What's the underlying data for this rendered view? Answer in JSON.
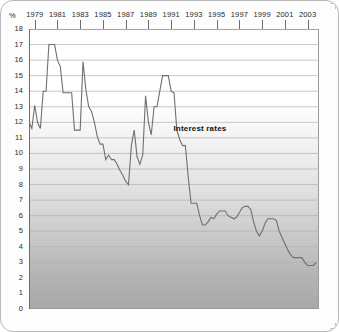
{
  "axes": {
    "y_unit_label": "%",
    "y_ticks": [
      "18",
      "17",
      "16",
      "15",
      "14",
      "13",
      "12",
      "11",
      "10",
      "9",
      "8",
      "7",
      "6",
      "5",
      "4",
      "3",
      "2",
      "1",
      "0"
    ],
    "x_ticks": [
      "1979",
      "1981",
      "1983",
      "1985",
      "1987",
      "1989",
      "1991",
      "1993",
      "1995",
      "1997",
      "1999",
      "2001",
      "2003"
    ]
  },
  "annotation": {
    "series_label": "Interest rates"
  },
  "colors": {
    "line": "#6f6f6f",
    "grid": "#b0b0b0",
    "axis": "#6e6e6e",
    "text": "#2b2b2b"
  },
  "chart_data": {
    "type": "line",
    "title": "",
    "subtitle": "",
    "xlabel": "",
    "ylabel": "%",
    "xlim": [
      1978.5,
      2004.0
    ],
    "ylim": [
      0,
      18
    ],
    "grid": true,
    "legend": "none",
    "annotations": [
      {
        "text": "Interest rates",
        "x": 1991.2,
        "y": 11.6
      }
    ],
    "xtick_values": [
      1979,
      1981,
      1983,
      1985,
      1987,
      1989,
      1991,
      1993,
      1995,
      1997,
      1999,
      2001,
      2003
    ],
    "ytick_values": [
      0,
      1,
      2,
      3,
      4,
      5,
      6,
      7,
      8,
      9,
      10,
      11,
      12,
      13,
      14,
      15,
      16,
      17,
      18
    ],
    "series": [
      {
        "name": "Interest rates",
        "x": [
          1978.5,
          1978.75,
          1979.0,
          1979.25,
          1979.5,
          1979.75,
          1980.0,
          1980.25,
          1980.5,
          1980.75,
          1981.0,
          1981.25,
          1981.5,
          1981.75,
          1982.0,
          1982.25,
          1982.5,
          1982.75,
          1983.0,
          1983.25,
          1983.5,
          1983.75,
          1984.0,
          1984.25,
          1984.5,
          1984.75,
          1985.0,
          1985.25,
          1985.5,
          1985.75,
          1986.0,
          1986.25,
          1986.5,
          1986.75,
          1987.0,
          1987.25,
          1987.5,
          1987.75,
          1988.0,
          1988.25,
          1988.5,
          1988.75,
          1989.0,
          1989.25,
          1989.5,
          1989.75,
          1990.0,
          1990.25,
          1990.5,
          1990.75,
          1991.0,
          1991.25,
          1991.5,
          1991.75,
          1992.0,
          1992.25,
          1992.5,
          1992.75,
          1993.0,
          1993.25,
          1993.5,
          1993.75,
          1994.0,
          1994.25,
          1994.5,
          1994.75,
          1995.0,
          1995.25,
          1995.5,
          1995.75,
          1996.0,
          1996.25,
          1996.5,
          1996.75,
          1997.0,
          1997.25,
          1997.5,
          1997.75,
          1998.0,
          1998.25,
          1998.5,
          1998.75,
          1999.0,
          1999.25,
          1999.5,
          1999.75,
          2000.0,
          2000.25,
          2000.5,
          2000.75,
          2001.0,
          2001.25,
          2001.5,
          2001.75,
          2002.0,
          2002.25,
          2002.5,
          2002.75,
          2003.0,
          2003.25,
          2003.5,
          2003.75
        ],
        "y": [
          12.0,
          11.6,
          13.1,
          12.0,
          11.6,
          14.0,
          14.0,
          17.0,
          17.0,
          17.0,
          16.0,
          15.6,
          13.9,
          13.9,
          13.9,
          13.9,
          11.5,
          11.5,
          11.5,
          15.9,
          14.1,
          13.0,
          12.7,
          12.0,
          11.1,
          10.6,
          10.6,
          9.6,
          9.9,
          9.6,
          9.6,
          9.3,
          8.9,
          8.6,
          8.2,
          8.0,
          10.5,
          11.5,
          9.8,
          9.3,
          9.9,
          13.7,
          12.0,
          11.2,
          13.0,
          13.0,
          14.0,
          15.0,
          15.0,
          15.0,
          14.0,
          13.9,
          11.5,
          10.9,
          10.5,
          10.5,
          8.5,
          6.8,
          6.8,
          6.8,
          6.0,
          5.4,
          5.4,
          5.6,
          5.9,
          5.8,
          6.1,
          6.3,
          6.3,
          6.3,
          6.0,
          5.9,
          5.8,
          5.9,
          6.2,
          6.5,
          6.6,
          6.6,
          6.4,
          5.6,
          5.0,
          4.7,
          5.0,
          5.5,
          5.8,
          5.8,
          5.8,
          5.7,
          5.0,
          4.6,
          4.2,
          3.8,
          3.5,
          3.3,
          3.3,
          3.3,
          3.3,
          3.0,
          2.8,
          2.8,
          2.8,
          3.0
        ]
      }
    ]
  }
}
